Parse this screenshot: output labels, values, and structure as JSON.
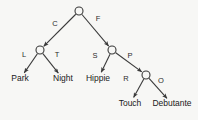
{
  "diagram": {
    "type": "tree",
    "background_color": "#f7f7f5",
    "line_color": "#3a3a3a",
    "text_color": "#1a1a1a",
    "nodes": [
      {
        "id": "root",
        "kind": "circle",
        "x": 79,
        "y": 11
      },
      {
        "id": "left",
        "kind": "circle",
        "x": 40,
        "y": 50
      },
      {
        "id": "right",
        "kind": "circle",
        "x": 112,
        "y": 50
      },
      {
        "id": "rr",
        "kind": "circle",
        "x": 146,
        "y": 75
      }
    ],
    "leaves": [
      {
        "id": "park",
        "label": "Park",
        "x": 20,
        "y": 79
      },
      {
        "id": "night",
        "label": "Night",
        "x": 63,
        "y": 79
      },
      {
        "id": "hippie",
        "label": "Hippie",
        "x": 98,
        "y": 79
      },
      {
        "id": "touch",
        "label": "Touch",
        "x": 130,
        "y": 104
      },
      {
        "id": "debutante",
        "label": "Debutante",
        "x": 172,
        "y": 104
      }
    ],
    "edges": [
      {
        "id": "e-c",
        "from": "root",
        "to": "left",
        "label": "C",
        "label_x": 55,
        "label_y": 24
      },
      {
        "id": "e-f",
        "from": "root",
        "to": "right",
        "label": "F",
        "label_x": 98,
        "label_y": 19
      },
      {
        "id": "e-l",
        "from": "left",
        "to": "park",
        "label": "L",
        "label_x": 24,
        "label_y": 55
      },
      {
        "id": "e-t",
        "from": "left",
        "to": "night",
        "label": "T",
        "label_x": 57,
        "label_y": 55
      },
      {
        "id": "e-s",
        "from": "right",
        "to": "hippie",
        "label": "S",
        "label_x": 95,
        "label_y": 56
      },
      {
        "id": "e-p",
        "from": "right",
        "to": "rr",
        "label": "P",
        "label_x": 130,
        "label_y": 56
      },
      {
        "id": "e-r",
        "from": "rr",
        "to": "touch",
        "label": "R",
        "label_x": 126,
        "label_y": 79
      },
      {
        "id": "e-o",
        "from": "rr",
        "to": "debutante",
        "label": "O",
        "label_x": 161,
        "label_y": 81
      }
    ]
  }
}
